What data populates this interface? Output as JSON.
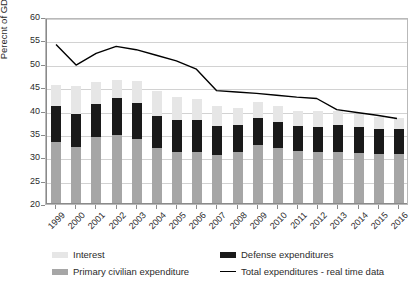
{
  "chart_data": {
    "type": "bar",
    "subtype": "stacked-bar-with-line-overlay",
    "title": "",
    "xlabel": "",
    "ylabel": "Perecnt of GDP",
    "ylim": [
      20,
      60
    ],
    "ytick_step": 5,
    "yticks": [
      20,
      25,
      30,
      35,
      40,
      45,
      50,
      55,
      60
    ],
    "grid": true,
    "grid_axis": "y",
    "legend_position": "bottom",
    "categories": [
      "1999",
      "2000",
      "2001",
      "2002",
      "2003",
      "2004",
      "2005",
      "2006",
      "2007",
      "2008",
      "2009",
      "2010",
      "2011",
      "2012",
      "2013",
      "2014",
      "2015",
      "2016"
    ],
    "series": [
      {
        "name": "Primary civilian expenditure",
        "type": "bar",
        "stack": "expenditure",
        "color": "#a6a6a6",
        "values": [
          33.3,
          32.1,
          34.3,
          34.8,
          34.0,
          31.9,
          31.1,
          31.1,
          30.5,
          31.1,
          32.6,
          31.9,
          31.3,
          31.2,
          31.1,
          31.0,
          30.7,
          30.6
        ]
      },
      {
        "name": "Defense expenditures",
        "type": "bar",
        "stack": "expenditure",
        "color": "#1a1a1a",
        "cumulative_top": [
          40.9,
          39.2,
          41.4,
          42.7,
          41.6,
          38.9,
          37.9,
          38.0,
          36.6,
          36.8,
          38.4,
          37.6,
          36.6,
          36.5,
          36.9,
          36.4,
          36.1,
          36.1
        ],
        "values": [
          7.6,
          7.1,
          7.1,
          7.9,
          7.6,
          7.0,
          6.8,
          6.9,
          6.1,
          5.7,
          5.8,
          5.7,
          5.3,
          5.3,
          5.8,
          5.4,
          5.4,
          5.5
        ]
      },
      {
        "name": "Interest",
        "type": "bar",
        "stack": "expenditure",
        "color": "#e6e6e6",
        "cumulative_top": [
          45.5,
          45.2,
          46.0,
          46.5,
          46.3,
          44.1,
          42.9,
          42.4,
          41.0,
          40.6,
          41.8,
          40.9,
          39.9,
          39.8,
          40.0,
          39.2,
          38.6,
          38.4
        ],
        "values": [
          4.6,
          6.0,
          4.6,
          3.8,
          4.7,
          5.2,
          5.0,
          4.4,
          4.4,
          3.8,
          3.4,
          3.3,
          3.3,
          3.3,
          3.1,
          2.8,
          2.5,
          2.3
        ]
      },
      {
        "name": "Total expenditures - real time data",
        "type": "line",
        "color": "#000000",
        "values": [
          54.5,
          50.1,
          52.6,
          54.1,
          53.4,
          52.2,
          51.0,
          49.2,
          44.6,
          44.3,
          44.0,
          43.6,
          43.2,
          42.9,
          40.5,
          39.9,
          39.3,
          38.6
        ]
      }
    ]
  },
  "legend": {
    "items": [
      {
        "label": "Interest",
        "swatch": "interest"
      },
      {
        "label": "Defense expenditures",
        "swatch": "defense"
      },
      {
        "label": "Primary civilian expenditure",
        "swatch": "civilian"
      },
      {
        "label": "Total expenditures - real time data",
        "swatch": "line"
      }
    ]
  }
}
